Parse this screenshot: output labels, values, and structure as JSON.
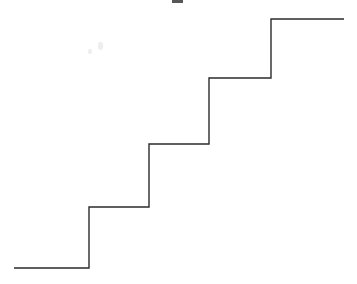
{
  "figure": {
    "title": "",
    "background_color": "#ffffff",
    "line_color": "#2b2b2b",
    "line_width": 1.4,
    "width": 357,
    "height": 284
  },
  "artifact": {
    "label": "cropped-ink-mark",
    "x": 172,
    "y": 0,
    "width": 11,
    "height": 3
  },
  "chart_data": {
    "type": "line",
    "title": "",
    "subtitle": "",
    "xlabel": "",
    "ylabel": "",
    "style": "step-post",
    "grid": false,
    "legend": null,
    "axes_visible": false,
    "tick_labels_visible": false,
    "xlim": [
      0,
      357
    ],
    "ylim": [
      0,
      284
    ],
    "x_axis_direction": "left-to-right",
    "y_axis_direction": "bottom-is-lower-value",
    "step_count": 5,
    "series": [
      {
        "name": "staircase",
        "color": "#2b2b2b",
        "points_pixel": [
          [
            14,
            268
          ],
          [
            89,
            268
          ],
          [
            89,
            207
          ],
          [
            149,
            207
          ],
          [
            149,
            144
          ],
          [
            209,
            144
          ],
          [
            209,
            78
          ],
          [
            271,
            78
          ],
          [
            271,
            19
          ],
          [
            344,
            19
          ]
        ],
        "steps": [
          {
            "index": 1,
            "x_start": 14,
            "x_end": 89,
            "y_pixel": 268,
            "level": 0,
            "tread_width": 75,
            "riser_height": 61
          },
          {
            "index": 2,
            "x_start": 89,
            "x_end": 149,
            "y_pixel": 207,
            "level": 1,
            "tread_width": 60,
            "riser_height": 63
          },
          {
            "index": 3,
            "x_start": 149,
            "x_end": 209,
            "y_pixel": 144,
            "level": 2,
            "tread_width": 60,
            "riser_height": 66
          },
          {
            "index": 4,
            "x_start": 209,
            "x_end": 271,
            "y_pixel": 78,
            "level": 3,
            "tread_width": 62,
            "riser_height": 59
          },
          {
            "index": 5,
            "x_start": 271,
            "x_end": 344,
            "y_pixel": 19,
            "level": 4,
            "tread_width": 73,
            "riser_height": 0
          }
        ],
        "categories": [
          "1",
          "2",
          "3",
          "4",
          "5"
        ],
        "values": [
          0,
          1,
          2,
          3,
          4
        ]
      }
    ],
    "path_d": "M 14 268 L 89 268 L 89 207 L 149 207 L 149 144 L 209 144 L 209 78 L 271 78 L 271 19 L 344 19"
  }
}
